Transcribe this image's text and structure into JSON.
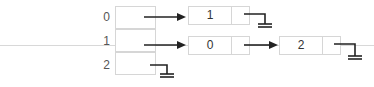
{
  "diagram": {
    "type": "hash-table-separate-chaining",
    "buckets": [
      {
        "index": "0",
        "chain": [
          "1"
        ]
      },
      {
        "index": "1",
        "chain": [
          "0",
          "2"
        ]
      },
      {
        "index": "2",
        "chain": []
      }
    ],
    "null_symbol": "ground-icon",
    "colors": {
      "line": "#222222",
      "border": "#d6d6d6",
      "text": "#333333"
    }
  }
}
